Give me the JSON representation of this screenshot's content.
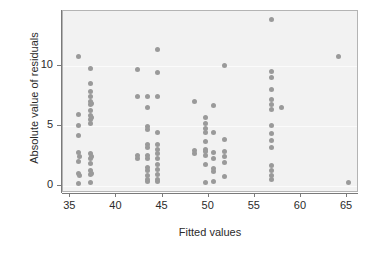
{
  "chart_data": {
    "type": "scatter",
    "title": "",
    "xlabel": "Fitted values",
    "ylabel": "Absolute value of residuals",
    "xlim": [
      34.2,
      66.3
    ],
    "ylim": [
      -0.55,
      14.6
    ],
    "xticks": [
      35,
      40,
      45,
      50,
      55,
      60,
      65
    ],
    "xticklabels": [
      "35",
      "40",
      "45",
      "50",
      "55",
      "60",
      "65"
    ],
    "yticks": [
      0,
      5,
      10
    ],
    "yticklabels": [
      "0",
      "5",
      "10"
    ],
    "grid": "horizontal-white-gridlines-at-yticks",
    "legend": "none",
    "panel_background": "#f2f2f2",
    "point_color": "#9a9a9a",
    "point_count": 99,
    "points": [
      [
        35.9,
        10.8
      ],
      [
        35.9,
        6.0
      ],
      [
        35.9,
        5.1
      ],
      [
        35.9,
        4.2
      ],
      [
        35.9,
        2.8
      ],
      [
        35.9,
        2.1
      ],
      [
        35.9,
        1.1
      ],
      [
        35.9,
        0.2
      ],
      [
        36.0,
        2.5
      ],
      [
        36.0,
        0.9
      ],
      [
        37.2,
        9.8
      ],
      [
        37.2,
        8.6
      ],
      [
        37.2,
        7.9
      ],
      [
        37.2,
        7.5
      ],
      [
        37.2,
        7.1
      ],
      [
        37.2,
        6.8
      ],
      [
        37.2,
        6.3
      ],
      [
        37.2,
        5.9
      ],
      [
        37.2,
        5.6
      ],
      [
        37.2,
        5.2
      ],
      [
        37.2,
        2.7
      ],
      [
        37.2,
        2.3
      ],
      [
        37.2,
        1.9
      ],
      [
        37.2,
        1.3
      ],
      [
        37.2,
        1.0
      ],
      [
        37.2,
        0.3
      ],
      [
        37.3,
        6.9
      ],
      [
        37.3,
        5.7
      ],
      [
        37.3,
        2.5
      ],
      [
        37.3,
        1.1
      ],
      [
        42.3,
        9.7
      ],
      [
        42.3,
        7.5
      ],
      [
        42.3,
        2.6
      ],
      [
        42.3,
        2.3
      ],
      [
        43.4,
        7.5
      ],
      [
        43.4,
        6.6
      ],
      [
        43.4,
        5.0
      ],
      [
        43.4,
        4.7
      ],
      [
        43.4,
        3.5
      ],
      [
        43.4,
        3.2
      ],
      [
        43.4,
        2.6
      ],
      [
        43.4,
        2.3
      ],
      [
        43.4,
        1.6
      ],
      [
        43.4,
        1.3
      ],
      [
        43.4,
        0.9
      ],
      [
        43.4,
        0.6
      ],
      [
        43.4,
        0.4
      ],
      [
        44.4,
        11.4
      ],
      [
        44.4,
        9.5
      ],
      [
        44.4,
        7.5
      ],
      [
        44.4,
        4.5
      ],
      [
        44.4,
        3.5
      ],
      [
        44.4,
        3.1
      ],
      [
        44.4,
        2.7
      ],
      [
        44.4,
        2.3
      ],
      [
        44.4,
        1.8
      ],
      [
        44.4,
        1.4
      ],
      [
        44.4,
        1.0
      ],
      [
        44.4,
        0.6
      ],
      [
        44.4,
        0.4
      ],
      [
        48.5,
        7.1
      ],
      [
        48.5,
        3.0
      ],
      [
        48.5,
        2.7
      ],
      [
        49.6,
        5.7
      ],
      [
        49.6,
        5.2
      ],
      [
        49.6,
        4.8
      ],
      [
        49.6,
        4.5
      ],
      [
        49.6,
        3.7
      ],
      [
        49.6,
        3.1
      ],
      [
        49.6,
        2.9
      ],
      [
        49.6,
        2.6
      ],
      [
        49.6,
        1.8
      ],
      [
        49.6,
        0.3
      ],
      [
        50.5,
        6.7
      ],
      [
        50.5,
        4.5
      ],
      [
        50.5,
        2.8
      ],
      [
        50.5,
        2.3
      ],
      [
        50.5,
        1.5
      ],
      [
        50.5,
        1.2
      ],
      [
        50.5,
        0.4
      ],
      [
        51.7,
        10.1
      ],
      [
        51.7,
        3.9
      ],
      [
        51.7,
        2.9
      ],
      [
        51.7,
        2.5
      ],
      [
        51.7,
        2.0
      ],
      [
        51.7,
        0.8
      ],
      [
        56.8,
        13.9
      ],
      [
        56.8,
        9.6
      ],
      [
        56.8,
        9.1
      ],
      [
        56.8,
        8.1
      ],
      [
        56.8,
        7.2
      ],
      [
        56.8,
        6.8
      ],
      [
        56.8,
        6.4
      ],
      [
        56.8,
        5.1
      ],
      [
        56.8,
        4.4
      ],
      [
        56.8,
        3.8
      ],
      [
        56.8,
        3.2
      ],
      [
        56.8,
        1.7
      ],
      [
        56.8,
        1.3
      ],
      [
        56.8,
        0.9
      ],
      [
        56.8,
        0.6
      ],
      [
        57.9,
        6.6
      ],
      [
        64.1,
        10.8
      ],
      [
        65.2,
        0.3
      ]
    ]
  }
}
